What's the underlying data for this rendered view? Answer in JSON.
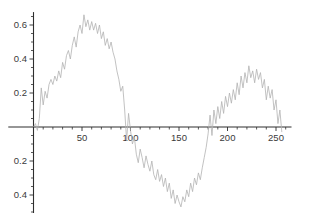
{
  "chart_data": {
    "type": "line",
    "title": "",
    "xlabel": "",
    "ylabel": "",
    "grid": false,
    "legend_position": "none",
    "xlim": [
      -26,
      266
    ],
    "ylim": [
      -0.506,
      0.676
    ],
    "x_ticks": {
      "major": [
        {
          "value": 50,
          "label": "50"
        },
        {
          "value": 100,
          "label": "100"
        },
        {
          "value": 150,
          "label": "150"
        },
        {
          "value": 200,
          "label": "200"
        },
        {
          "value": 250,
          "label": "250"
        }
      ],
      "minor_start": 10,
      "minor_end": 260,
      "minor_step": 10
    },
    "y_ticks": {
      "major": [
        {
          "value": 0.6,
          "label": "0.6"
        },
        {
          "value": 0.4,
          "label": "0.4"
        },
        {
          "value": 0.2,
          "label": "0.2"
        },
        {
          "value": -0.2,
          "label": "0.2"
        },
        {
          "value": -0.4,
          "label": "0.4"
        }
      ],
      "minor_start": -0.5,
      "minor_end": 0.65,
      "minor_step": 0.05
    },
    "series": [
      {
        "name": "noisy-damped-sine-signal",
        "x_start": 0,
        "x_step": 2,
        "values": [
          0.0,
          0.02,
          -0.02,
          0.05,
          0.23,
          0.13,
          0.21,
          0.17,
          0.25,
          0.28,
          0.25,
          0.3,
          0.27,
          0.33,
          0.29,
          0.38,
          0.34,
          0.42,
          0.45,
          0.4,
          0.48,
          0.53,
          0.47,
          0.56,
          0.6,
          0.55,
          0.66,
          0.59,
          0.63,
          0.57,
          0.62,
          0.57,
          0.61,
          0.55,
          0.6,
          0.52,
          0.56,
          0.48,
          0.52,
          0.46,
          0.5,
          0.44,
          0.4,
          0.33,
          0.28,
          0.21,
          0.24,
          0.1,
          -0.08,
          0.08,
          -0.02,
          -0.1,
          -0.06,
          -0.16,
          -0.21,
          -0.13,
          -0.18,
          -0.24,
          -0.17,
          -0.22,
          -0.26,
          -0.2,
          -0.28,
          -0.31,
          -0.25,
          -0.32,
          -0.28,
          -0.35,
          -0.3,
          -0.38,
          -0.33,
          -0.42,
          -0.37,
          -0.45,
          -0.4,
          -0.44,
          -0.47,
          -0.41,
          -0.44,
          -0.37,
          -0.41,
          -0.33,
          -0.38,
          -0.3,
          -0.34,
          -0.27,
          -0.31,
          -0.24,
          -0.18,
          -0.12,
          -0.04,
          0.07,
          -0.05,
          0.1,
          0.02,
          0.12,
          0.05,
          0.15,
          0.08,
          0.18,
          0.12,
          0.2,
          0.14,
          0.22,
          0.16,
          0.26,
          0.19,
          0.3,
          0.23,
          0.32,
          0.26,
          0.36,
          0.29,
          0.33,
          0.26,
          0.34,
          0.28,
          0.32,
          0.23,
          0.28,
          0.16,
          0.24,
          0.17,
          0.22,
          0.1,
          0.16,
          0.02,
          0.1,
          -0.03
        ]
      }
    ],
    "colors": {
      "line": "#b3b3b3",
      "axis": "#2e2e2e",
      "tick_label": "#3a3a3a",
      "background": "#ffffff"
    }
  }
}
